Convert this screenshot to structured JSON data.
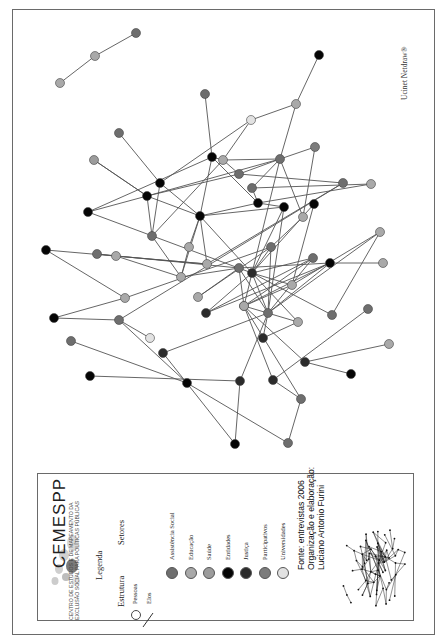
{
  "watermark": "Ucinet Netdraw®",
  "legend": {
    "org_name": "CEMESPP",
    "org_subtitle_line1": "CENTRO DE ESTUDOS E DE MAPEAMENTO DA",
    "org_subtitle_line2": "EXCLUSÃO SOCIAL PARA POLÍTICAS PÚBLICAS",
    "title": "Legenda",
    "structure_heading": "Estrutura",
    "sectors_heading": "Setores",
    "structure_items": [
      {
        "label": "Pessoas",
        "icon": "circle-outline-icon"
      },
      {
        "label": "Elos",
        "icon": "line-icon"
      }
    ],
    "sectors": [
      {
        "label": "Assistência Social",
        "color": "#6e6e6e"
      },
      {
        "label": "Educação",
        "color": "#a9a9a9"
      },
      {
        "label": "Saúde",
        "color": "#9c9c9c"
      },
      {
        "label": "Entidades",
        "color": "#050505"
      },
      {
        "label": "Justiça",
        "color": "#2b2b2b"
      },
      {
        "label": "Participativos",
        "color": "#7c7c7c"
      },
      {
        "label": "Universidades",
        "color": "#e2e2e2"
      }
    ],
    "credits": [
      "Fonte: entrevistas 2006",
      "Organização e elaboração:",
      "Luciano Antonio Furini"
    ]
  },
  "network": {
    "nodes": [
      {
        "id": "n1",
        "sector": "Educação"
      },
      {
        "id": "n2",
        "sector": "Educação"
      },
      {
        "id": "n3",
        "sector": "Assistência Social"
      },
      {
        "id": "n4",
        "sector": "Assistência Social"
      },
      {
        "id": "n5",
        "sector": "Assistência Social"
      },
      {
        "id": "n6",
        "sector": "Entidades"
      },
      {
        "id": "n7",
        "sector": "Educação"
      },
      {
        "id": "n8",
        "sector": "Universidades"
      },
      {
        "id": "n9",
        "sector": "Entidades"
      },
      {
        "id": "n10",
        "sector": "Educação"
      },
      {
        "id": "n11",
        "sector": "Assistência Social"
      },
      {
        "id": "n12",
        "sector": "Participativos"
      },
      {
        "id": "n13",
        "sector": "Assistência Social"
      },
      {
        "id": "n14",
        "sector": "Assistência Social"
      },
      {
        "id": "n15",
        "sector": "Educação"
      },
      {
        "id": "n16",
        "sector": "Saúde"
      },
      {
        "id": "n17",
        "sector": "Entidades"
      },
      {
        "id": "n18",
        "sector": "Entidades"
      },
      {
        "id": "n19",
        "sector": "Entidades"
      },
      {
        "id": "n20",
        "sector": "Entidades"
      },
      {
        "id": "n21",
        "sector": "Assistência Social"
      },
      {
        "id": "n22",
        "sector": "Entidades"
      },
      {
        "id": "n23",
        "sector": "Assistência Social"
      },
      {
        "id": "n24",
        "sector": "Educação"
      },
      {
        "id": "n25",
        "sector": "Educação"
      },
      {
        "id": "n26",
        "sector": "Assistência Social"
      },
      {
        "id": "n27",
        "sector": "Educação"
      },
      {
        "id": "n28",
        "sector": "Assistência Social"
      },
      {
        "id": "n29",
        "sector": "Entidades"
      },
      {
        "id": "n30",
        "sector": "Educação"
      },
      {
        "id": "n31",
        "sector": "Entidades"
      },
      {
        "id": "n32",
        "sector": "Educação"
      },
      {
        "id": "n33",
        "sector": "Educação"
      },
      {
        "id": "n34",
        "sector": "Assistência Social"
      },
      {
        "id": "n35",
        "sector": "Justiça"
      },
      {
        "id": "n36",
        "sector": "Assistência Social"
      },
      {
        "id": "n37",
        "sector": "Educação"
      },
      {
        "id": "n38",
        "sector": "Entidades"
      },
      {
        "id": "n39",
        "sector": "Assistência Social"
      },
      {
        "id": "n40",
        "sector": "Participativos"
      },
      {
        "id": "n41",
        "sector": "Educação"
      },
      {
        "id": "n42",
        "sector": "Entidades"
      },
      {
        "id": "n43",
        "sector": "Justiça"
      },
      {
        "id": "n44",
        "sector": "Assistência Social"
      },
      {
        "id": "n45",
        "sector": "Educação"
      },
      {
        "id": "n46",
        "sector": "Educação"
      },
      {
        "id": "n47",
        "sector": "Justiça"
      },
      {
        "id": "n48",
        "sector": "Justiça"
      },
      {
        "id": "n49",
        "sector": "Educação"
      },
      {
        "id": "n50",
        "sector": "Justiça"
      },
      {
        "id": "n51",
        "sector": "Justiça"
      },
      {
        "id": "n52",
        "sector": "Assistência Social"
      },
      {
        "id": "n53",
        "sector": "Assistência Social"
      },
      {
        "id": "n54",
        "sector": "Entidades"
      },
      {
        "id": "n55",
        "sector": "Assistência Social"
      },
      {
        "id": "n56",
        "sector": "Assistência Social"
      },
      {
        "id": "n57",
        "sector": "Universidades"
      },
      {
        "id": "n58",
        "sector": "Justiça"
      },
      {
        "id": "n59",
        "sector": "Entidades"
      },
      {
        "id": "n60",
        "sector": "Entidades"
      },
      {
        "id": "n61",
        "sector": "Assistência Social"
      },
      {
        "id": "n62",
        "sector": "Entidades"
      },
      {
        "id": "n63",
        "sector": "Educação"
      }
    ],
    "edges": [
      [
        "n1",
        "n2"
      ],
      [
        "n2",
        "n3"
      ],
      [
        "n5",
        "n9"
      ],
      [
        "n6",
        "n7"
      ],
      [
        "n7",
        "n8"
      ],
      [
        "n7",
        "n11"
      ],
      [
        "n8",
        "n10"
      ],
      [
        "n8",
        "n17"
      ],
      [
        "n9",
        "n10"
      ],
      [
        "n10",
        "n11"
      ],
      [
        "n9",
        "n19"
      ],
      [
        "n9",
        "n20"
      ],
      [
        "n9",
        "n22"
      ],
      [
        "n11",
        "n12"
      ],
      [
        "n11",
        "n18"
      ],
      [
        "n11",
        "n13"
      ],
      [
        "n11",
        "n23"
      ],
      [
        "n11",
        "n35"
      ],
      [
        "n11",
        "n33"
      ],
      [
        "n10",
        "n13"
      ],
      [
        "n13",
        "n18"
      ],
      [
        "n10",
        "n21"
      ],
      [
        "n13",
        "n14"
      ],
      [
        "n12",
        "n33"
      ],
      [
        "n4",
        "n17"
      ],
      [
        "n16",
        "n18"
      ],
      [
        "n17",
        "n20"
      ],
      [
        "n17",
        "n21"
      ],
      [
        "n18",
        "n20"
      ],
      [
        "n18",
        "n21"
      ],
      [
        "n18",
        "n19"
      ],
      [
        "n16",
        "n18"
      ],
      [
        "n20",
        "n30"
      ],
      [
        "n20",
        "n22"
      ],
      [
        "n20",
        "n24"
      ],
      [
        "n20",
        "n29"
      ],
      [
        "n20",
        "n25"
      ],
      [
        "n20",
        "n35"
      ],
      [
        "n19",
        "n35"
      ],
      [
        "n21",
        "n25"
      ],
      [
        "n22",
        "n29"
      ],
      [
        "n22",
        "n15"
      ],
      [
        "n23",
        "n15"
      ],
      [
        "n23",
        "n22"
      ],
      [
        "n24",
        "n25"
      ],
      [
        "n26",
        "n27"
      ],
      [
        "n25",
        "n27"
      ],
      [
        "n25",
        "n28"
      ],
      [
        "n26",
        "n28"
      ],
      [
        "n27",
        "n30"
      ],
      [
        "n28",
        "n40"
      ],
      [
        "n28",
        "n37"
      ],
      [
        "n28",
        "n36"
      ],
      [
        "n28",
        "n42"
      ],
      [
        "n29",
        "n35"
      ],
      [
        "n29",
        "n36"
      ],
      [
        "n30",
        "n31"
      ],
      [
        "n30",
        "n14"
      ],
      [
        "n31",
        "n32"
      ],
      [
        "n32",
        "n34"
      ],
      [
        "n33",
        "n34"
      ],
      [
        "n34",
        "n36"
      ],
      [
        "n34",
        "n35"
      ],
      [
        "n34",
        "n37"
      ],
      [
        "n35",
        "n36"
      ],
      [
        "n35",
        "n38"
      ],
      [
        "n35",
        "n39"
      ],
      [
        "n35",
        "n40"
      ],
      [
        "n35",
        "n41"
      ],
      [
        "n35",
        "n43"
      ],
      [
        "n35",
        "n44"
      ],
      [
        "n35",
        "n46"
      ],
      [
        "n36",
        "n39"
      ],
      [
        "n36",
        "n42"
      ],
      [
        "n36",
        "n47"
      ],
      [
        "n36",
        "n48"
      ],
      [
        "n36",
        "n58"
      ],
      [
        "n36",
        "n45"
      ],
      [
        "n38",
        "n41"
      ],
      [
        "n40",
        "n41"
      ],
      [
        "n40",
        "n46"
      ],
      [
        "n40",
        "n39"
      ],
      [
        "n40",
        "n42"
      ],
      [
        "n40",
        "n49"
      ],
      [
        "n40",
        "n50"
      ],
      [
        "n40",
        "n51"
      ],
      [
        "n40",
        "n52"
      ],
      [
        "n41",
        "n45"
      ],
      [
        "n42",
        "n43"
      ],
      [
        "n44",
        "n45"
      ],
      [
        "n43",
        "n39"
      ],
      [
        "n46",
        "n47"
      ],
      [
        "n48",
        "n59"
      ],
      [
        "n48",
        "n60"
      ],
      [
        "n50",
        "n61"
      ],
      [
        "n50",
        "n52"
      ],
      [
        "n51",
        "n62"
      ],
      [
        "n51",
        "n63"
      ],
      [
        "n53",
        "n54"
      ],
      [
        "n54",
        "n55"
      ],
      [
        "n54",
        "n56"
      ],
      [
        "n55",
        "n57"
      ],
      [
        "n55",
        "n14"
      ],
      [
        "n58",
        "n59"
      ],
      [
        "n52",
        "n53"
      ]
    ]
  }
}
